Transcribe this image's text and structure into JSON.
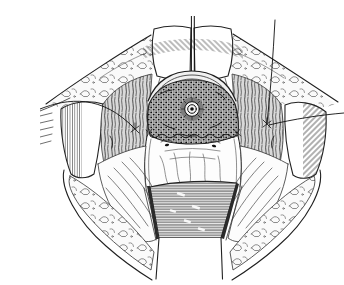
{
  "illustration": {
    "description": "Pen-and-ink surgical illustration of a deep oval operative field held open by retractors: paired flat blades with a central instrument shaft at top, curved lateral retractor blades at left and right, and a ribbed malleable retractor below, exposing a dark stippled cavity containing a small circular orifice above a smooth pale wall with two small dimples; stay-suture strands run out to the left, upper right and right; the wound edges show lobulated subcutaneous fat",
    "style": "black-and-white engraving line art",
    "ink_color": "#1a1a1a",
    "paper_color": "#ffffff",
    "parts": {
      "top_blades": "paired superior retractor blades",
      "instrument_shaft": "central vertical instrument shaft",
      "left_blade": "left curved lateral retractor blade",
      "right_blade": "right curved lateral retractor blade",
      "malleable_retractor": "ribbed malleable retractor entering from below",
      "arch": "arched tissue fold over the cavity",
      "cavity": "deep stippled operative cavity",
      "orifice": "small circular orifice with central os",
      "suture_line": "scalloped suture line across the cavity floor",
      "anterior_wall": "smooth anterior wall with paired dimples and vertical folds",
      "left_flap": "left pale tissue flap with long folds",
      "right_flap": "right pale tissue flap with long folds",
      "left_suture": "left stay-suture strand with knot",
      "right_sutures": "right stay-suture strands with knot",
      "wound_fat_edges": "lobulated subcutaneous fat along the wound edges",
      "shaggy_tissue": "shaggy dissected tissue flanking the cavity"
    }
  }
}
